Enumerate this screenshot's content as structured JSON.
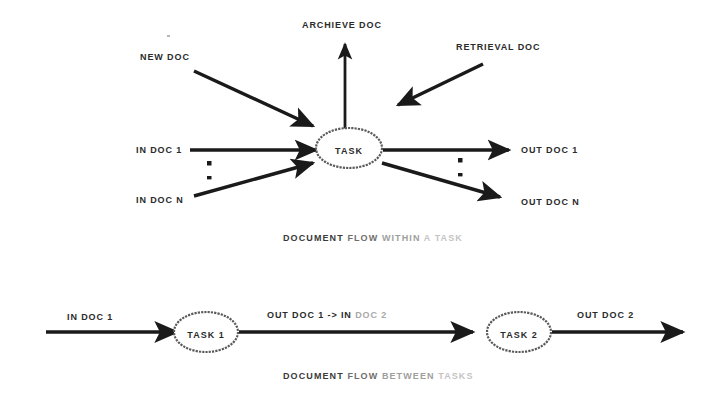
{
  "figure": {
    "ink_color": "#1a1a1a",
    "background_color": "#ffffff"
  },
  "diagram_top": {
    "caption_parts": {
      "a": "DOCUMENT",
      "b": " FLOW",
      "c": " WITHIN",
      "d": " A TASK"
    },
    "node": {
      "label": "TASK"
    },
    "inputs": [
      {
        "id": "new-doc",
        "label": "NEW DOC",
        "direction": "in",
        "from": "upper-left"
      },
      {
        "id": "retrieval-doc",
        "label": "RETRIEVAL DOC",
        "direction": "in",
        "from": "upper-right"
      },
      {
        "id": "in-doc-1",
        "label": "IN DOC 1",
        "direction": "in",
        "from": "left"
      },
      {
        "id": "in-doc-n",
        "label": "IN DOC N",
        "direction": "in",
        "from": "lower-left"
      }
    ],
    "outputs": [
      {
        "id": "archieve-doc",
        "label": "ARCHIEVE DOC",
        "direction": "out",
        "to": "up"
      },
      {
        "id": "out-doc-1",
        "label": "OUT DOC 1",
        "direction": "out",
        "to": "right"
      },
      {
        "id": "out-doc-n",
        "label": "OUT DOC N",
        "direction": "out",
        "to": "lower-right"
      }
    ],
    "ellipsis_marks": {
      "left": "vertical-ellipsis",
      "right": "vertical-ellipsis"
    }
  },
  "diagram_bottom": {
    "caption_parts": {
      "a": "DOCUMENT",
      "b": " FLOW",
      "c": " BETWEEN",
      "d": " TASKS"
    },
    "nodes": [
      {
        "id": "task-1",
        "label": "TASK 1"
      },
      {
        "id": "task-2",
        "label": "TASK 2"
      }
    ],
    "edges": [
      {
        "id": "edge-in",
        "label": "IN DOC 1"
      },
      {
        "id": "edge-middle",
        "label_head": "OUT DOC 1 -> IN",
        "label_tail": " DOC 2"
      },
      {
        "id": "edge-out",
        "label": "OUT DOC 2"
      }
    ]
  }
}
